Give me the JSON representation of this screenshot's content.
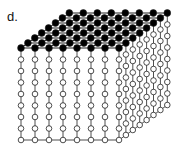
{
  "figure": {
    "panel_label": "d.",
    "grid": {
      "columns_x": 8,
      "columns_depth": 8,
      "open_rows": 8
    },
    "geometry": {
      "front_left_top": [
        21,
        48
      ],
      "step_x": [
        14,
        0
      ],
      "step_depth": [
        6.9,
        -5
      ],
      "step_down": 11.5
    },
    "colors": {
      "filled_node": "#000000",
      "open_node_fill": "#ffffff",
      "stroke": "#222222"
    },
    "legend": {
      "filled": "filled-node",
      "open": "open-node"
    }
  }
}
